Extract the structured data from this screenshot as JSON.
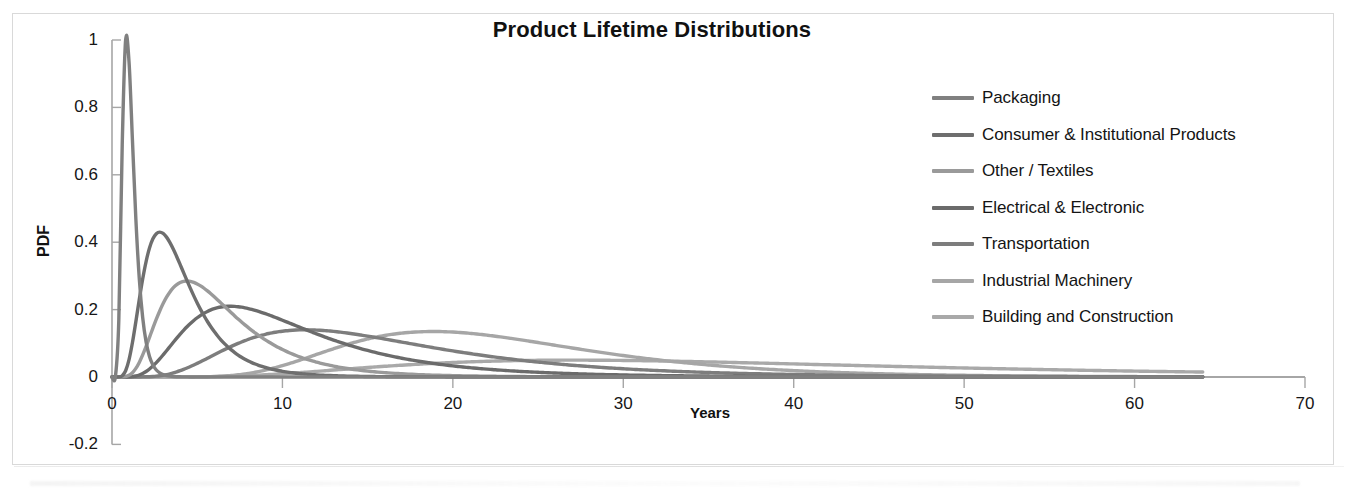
{
  "chart_data": {
    "type": "line",
    "title": "Product Lifetime Distributions",
    "xlabel": "Years",
    "ylabel": "PDF",
    "xlim": [
      0,
      70
    ],
    "ylim": [
      -0.2,
      1
    ],
    "xticks": [
      "0",
      "10",
      "20",
      "30",
      "40",
      "50",
      "60",
      "70"
    ],
    "xtick_values": [
      0,
      10,
      20,
      30,
      40,
      50,
      60,
      70
    ],
    "yticks": [
      "-0.2",
      "0",
      "0.2",
      "0.4",
      "0.6",
      "0.8",
      "1"
    ],
    "ytick_values": [
      -0.2,
      0,
      0.2,
      0.4,
      0.6,
      0.8,
      1
    ],
    "grid": false,
    "legend_position": "right",
    "series": [
      {
        "name": "Packaging",
        "color": "#808080",
        "peak_x": 1.0,
        "peak_y": 1.0,
        "mu": 0.0,
        "sigma": 0.4,
        "x_end": 64,
        "x": [
          0,
          0.3,
          0.5,
          0.7,
          0.9,
          1.0,
          1.2,
          1.5,
          2.0,
          2.5,
          3.0,
          4.0,
          5.0,
          7.0,
          10.0,
          20.0,
          40.0,
          64.0
        ],
        "y": [
          0,
          0.06,
          0.36,
          0.78,
          0.98,
          1.0,
          0.93,
          0.7,
          0.36,
          0.18,
          0.09,
          0.025,
          0.008,
          0.001,
          0,
          0,
          0,
          0
        ]
      },
      {
        "name": "Consumer & Institutional Products",
        "color": "#6e6e6e",
        "peak_x": 3.0,
        "peak_y": 0.43,
        "mu": 1.28,
        "sigma": 0.5,
        "x_end": 64,
        "x": [
          0,
          0.7,
          1.2,
          1.8,
          2.4,
          3.0,
          3.6,
          4.5,
          5.5,
          7.0,
          9.0,
          12.0,
          16.0,
          22.0,
          30.0,
          45.0,
          64.0
        ],
        "y": [
          0,
          0.02,
          0.12,
          0.29,
          0.4,
          0.43,
          0.42,
          0.35,
          0.26,
          0.16,
          0.085,
          0.035,
          0.012,
          0.003,
          0.001,
          0,
          0
        ]
      },
      {
        "name": "Other / Textiles",
        "color": "#9a9a9a",
        "peak_x": 5.0,
        "peak_y": 0.285,
        "mu": 1.75,
        "sigma": 0.52,
        "x_end": 64,
        "x": [
          0,
          1.0,
          2.0,
          3.0,
          4.0,
          5.0,
          6.0,
          7.5,
          9.0,
          11.0,
          14.0,
          18.0,
          24.0,
          32.0,
          45.0,
          64.0
        ],
        "y": [
          0,
          0.005,
          0.06,
          0.17,
          0.25,
          0.285,
          0.28,
          0.24,
          0.19,
          0.13,
          0.07,
          0.032,
          0.01,
          0.003,
          0,
          0
        ]
      },
      {
        "name": "Electrical & Electronic",
        "color": "#6b6b6b",
        "peak_x": 8.0,
        "peak_y": 0.21,
        "mu": 2.24,
        "sigma": 0.55,
        "x_end": 64,
        "x": [
          0,
          2.0,
          3.5,
          5.0,
          6.5,
          8.0,
          9.5,
          11.5,
          14.0,
          17.0,
          21.0,
          26.0,
          33.0,
          42.0,
          55.0,
          64.0
        ],
        "y": [
          0,
          0.012,
          0.07,
          0.145,
          0.195,
          0.21,
          0.205,
          0.18,
          0.14,
          0.1,
          0.06,
          0.032,
          0.013,
          0.004,
          0.001,
          0
        ]
      },
      {
        "name": "Transportation",
        "color": "#7d7d7d",
        "peak_x": 12.5,
        "peak_y": 0.14,
        "mu": 2.7,
        "sigma": 0.52,
        "x_end": 64,
        "x": [
          0,
          3.0,
          5.5,
          8.0,
          10.5,
          12.5,
          15.0,
          18.0,
          22.0,
          26.0,
          31.0,
          37.0,
          44.0,
          52.0,
          64.0
        ],
        "y": [
          0,
          0.003,
          0.035,
          0.09,
          0.128,
          0.14,
          0.135,
          0.118,
          0.09,
          0.065,
          0.042,
          0.024,
          0.012,
          0.005,
          0.001
        ]
      },
      {
        "name": "Industrial Machinery",
        "color": "#a6a6a6",
        "peak_x": 20.0,
        "peak_y": 0.135,
        "mu": 3.08,
        "sigma": 0.38,
        "x_end": 64,
        "x": [
          0,
          5.0,
          9.0,
          12.0,
          15.0,
          17.5,
          20.0,
          23.0,
          26.0,
          30.0,
          35.0,
          41.0,
          48.0,
          56.0,
          64.0
        ],
        "y": [
          0,
          0.001,
          0.02,
          0.06,
          0.105,
          0.128,
          0.135,
          0.128,
          0.11,
          0.08,
          0.048,
          0.024,
          0.01,
          0.004,
          0.001
        ]
      },
      {
        "name": "Building and Construction",
        "color": "#a9a9a9",
        "peak_x": 33.0,
        "peak_y": 0.05,
        "mu": 3.6,
        "sigma": 0.55,
        "x_end": 64,
        "x": [
          0,
          6.0,
          11.0,
          16.0,
          21.0,
          26.0,
          30.0,
          33.0,
          37.0,
          42.0,
          47.0,
          52.0,
          57.0,
          64.0
        ],
        "y": [
          0,
          0.0005,
          0.008,
          0.022,
          0.036,
          0.046,
          0.049,
          0.05,
          0.048,
          0.042,
          0.034,
          0.027,
          0.02,
          0.012
        ]
      }
    ]
  },
  "legend": {
    "items": [
      {
        "label": "Packaging",
        "color": "#808080"
      },
      {
        "label": "Consumer & Institutional Products",
        "color": "#6e6e6e"
      },
      {
        "label": "Other / Textiles",
        "color": "#9a9a9a"
      },
      {
        "label": "Electrical & Electronic",
        "color": "#6b6b6b"
      },
      {
        "label": "Transportation",
        "color": "#7d7d7d"
      },
      {
        "label": "Industrial Machinery",
        "color": "#a6a6a6"
      },
      {
        "label": "Building and Construction",
        "color": "#a9a9a9"
      }
    ]
  },
  "axis_color": "#a6a6a6",
  "text_color": "#161616"
}
